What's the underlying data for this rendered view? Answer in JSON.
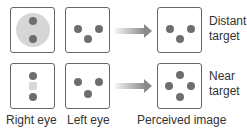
{
  "rows": [
    {
      "name": "distant",
      "label_line1": "Distant",
      "label_line2": "target"
    },
    {
      "name": "near",
      "label_line1": "Near",
      "label_line2": "target"
    }
  ],
  "columns": {
    "right_eye": "Right eye",
    "left_eye": "Left eye",
    "perceived": "Perceived image"
  },
  "colors": {
    "dot": "#6e6e6e",
    "suppression": "#d6d6d6",
    "border": "#666666",
    "arrow": "#8a8a8a"
  }
}
